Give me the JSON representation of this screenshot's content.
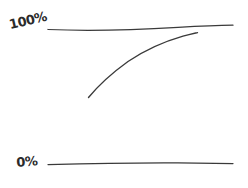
{
  "figure": {
    "kind": "hand-drawn-sketch",
    "background_color": "#ffffff",
    "ink_color": "#3a3a3a",
    "width": 248,
    "height": 188
  },
  "labels": {
    "top": "100%",
    "bottom": "0%"
  },
  "chart_data": {
    "type": "line",
    "title": "",
    "subtitle": "",
    "xlabel": "",
    "ylabel": "",
    "style": "hand-drawn sketch, no axes box, no gridlines",
    "grid": false,
    "legend": null,
    "ylim": [
      0,
      100
    ],
    "ytick_labels": [
      "0%",
      "100%"
    ],
    "ytick_values": [
      0,
      100
    ],
    "xtick_labels": [],
    "annotations": [],
    "series": [
      {
        "name": "100% asymptote",
        "role": "upper-reference-line",
        "shape": "near-horizontal straight line",
        "x": [
          0,
          20,
          40,
          60,
          80,
          100
        ],
        "values": [
          100,
          100,
          100,
          100,
          100,
          100
        ]
      },
      {
        "name": "0% baseline",
        "role": "lower-reference-line",
        "shape": "near-horizontal straight line",
        "x": [
          0,
          20,
          40,
          60,
          80,
          100
        ],
        "values": [
          0,
          0,
          0,
          0,
          0,
          0
        ]
      },
      {
        "name": "growth curve",
        "role": "data-curve",
        "shape": "concave-down asymptotic rise approaching 100%",
        "x": [
          22,
          30,
          40,
          50,
          60,
          70,
          80
        ],
        "values": [
          50,
          62,
          74,
          83,
          89,
          93,
          95
        ]
      }
    ]
  },
  "strokes": {
    "top_line": {
      "name": "100% reference line",
      "path": "M 48 29.5 C 90 31.2, 140 29.6, 178 27.4 C 200 26.2, 220 25.4, 233 25.2"
    },
    "bottom_line": {
      "name": "0% reference line",
      "path": "M 48 164.6 C 90 163.4, 140 162.6, 178 162.8 C 200 163.0, 220 163.4, 233 163.6"
    },
    "curve": {
      "name": "asymptotic growth curve",
      "path": "M 88.5 97.5 C 98 86, 112 73, 128 61.5 C 146 49.5, 168 40.5, 183 36.2 C 190 34.3, 195 33.2, 197.5 32.6"
    }
  }
}
